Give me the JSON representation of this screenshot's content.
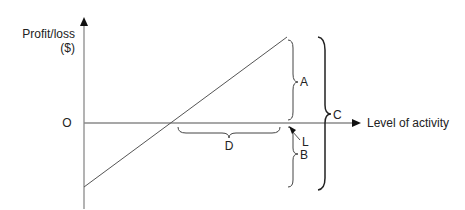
{
  "diagram": {
    "y_axis_label_line1": "Profit/loss",
    "y_axis_label_line2": "($)",
    "x_axis_label": "Level of activity",
    "origin_label": "O",
    "annotations": {
      "A": "A",
      "B": "B",
      "C": "C",
      "D": "D",
      "L": "L"
    }
  }
}
